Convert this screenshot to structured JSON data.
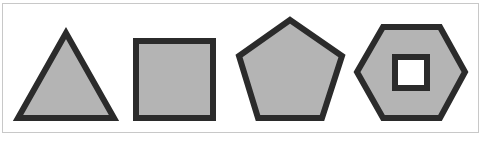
{
  "figure": {
    "shapes": [
      {
        "name": "triangle",
        "sides": 3,
        "fill": "#b4b4b4",
        "stroke": "#2b2b2b",
        "points": "66,33 18,118 114,118"
      },
      {
        "name": "square",
        "sides": 4,
        "fill": "#b4b4b4",
        "stroke": "#2b2b2b",
        "points": "136,41 213,41 213,118 136,118"
      },
      {
        "name": "pentagon",
        "sides": 5,
        "fill": "#b4b4b4",
        "stroke": "#2b2b2b",
        "points": "290,20 342,56 322,118 258,118 239,56"
      },
      {
        "name": "hexagon-with-square-hole",
        "sides": 6,
        "fill": "#b4b4b4",
        "stroke": "#2b2b2b",
        "points": "383,27 440,27 465,72 440,118 383,118 357,72",
        "hole": {
          "x": 395,
          "y": 57,
          "width": 32,
          "height": 31,
          "fill": "#ffffff"
        }
      }
    ],
    "frame_border_color": "#c8c8c8",
    "stroke_width": 6
  }
}
